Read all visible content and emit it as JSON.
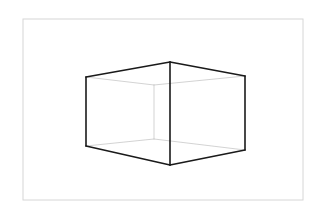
{
  "figure": {
    "title": "",
    "colors": {
      "background": "#ffffff",
      "frame": "#d6d6d6",
      "visible_edge": "#1a1a1a",
      "hidden_edge": "#c8c8c8"
    },
    "frame": {
      "x": 23,
      "y": 19,
      "width": 280,
      "height": 181
    },
    "visible_edges": [
      {
        "name": "top-left-edge",
        "x1": 86,
        "y1": 77,
        "x2": 170,
        "y2": 62
      },
      {
        "name": "top-right-edge",
        "x1": 170,
        "y1": 62,
        "x2": 245,
        "y2": 76
      },
      {
        "name": "left-vertical-edge",
        "x1": 86,
        "y1": 77,
        "x2": 86,
        "y2": 146
      },
      {
        "name": "front-vertical-edge",
        "x1": 170,
        "y1": 62,
        "x2": 170,
        "y2": 165
      },
      {
        "name": "right-vertical-edge",
        "x1": 245,
        "y1": 76,
        "x2": 245,
        "y2": 150
      },
      {
        "name": "bottom-left-edge",
        "x1": 86,
        "y1": 146,
        "x2": 170,
        "y2": 165
      },
      {
        "name": "bottom-right-edge",
        "x1": 170,
        "y1": 165,
        "x2": 245,
        "y2": 150
      }
    ],
    "hidden_edges": [
      {
        "name": "back-top-left-edge",
        "x1": 86,
        "y1": 77,
        "x2": 154,
        "y2": 85
      },
      {
        "name": "back-top-right-edge",
        "x1": 154,
        "y1": 85,
        "x2": 245,
        "y2": 76
      },
      {
        "name": "back-vertical-edge",
        "x1": 154,
        "y1": 85,
        "x2": 154,
        "y2": 139
      },
      {
        "name": "back-bottom-left-edge",
        "x1": 86,
        "y1": 146,
        "x2": 154,
        "y2": 139
      },
      {
        "name": "back-bottom-right-edge",
        "x1": 154,
        "y1": 139,
        "x2": 245,
        "y2": 150
      }
    ]
  }
}
